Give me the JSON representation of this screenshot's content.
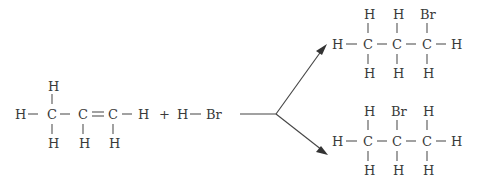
{
  "reaction": {
    "description": "Addition of HBr to propene giving two possible bromopropane products",
    "reactant_1": {
      "name": "propene",
      "formula_atoms": {
        "top": [
          "H",
          "",
          ""
        ],
        "row": [
          "H",
          "C",
          "C",
          "C",
          "H"
        ],
        "bottom": [
          "H",
          "H",
          "H"
        ],
        "bonds_row": [
          "—",
          "—",
          "=",
          "—"
        ]
      }
    },
    "plus": "+",
    "reactant_2": {
      "name": "hydrogen bromide",
      "atoms": [
        "H",
        "Br"
      ],
      "bond": "—"
    },
    "arrow": {
      "type": "branching",
      "branches": 2
    },
    "product_1": {
      "name": "1-bromopropane",
      "top": [
        "H",
        "H",
        "Br"
      ],
      "row": [
        "H",
        "C",
        "C",
        "C",
        "H"
      ],
      "bottom": [
        "H",
        "H",
        "H"
      ]
    },
    "product_2": {
      "name": "2-bromopropane",
      "top": [
        "H",
        "Br",
        "H"
      ],
      "row": [
        "H",
        "C",
        "C",
        "C",
        "H"
      ],
      "bottom": [
        "H",
        "H",
        "H"
      ]
    }
  }
}
